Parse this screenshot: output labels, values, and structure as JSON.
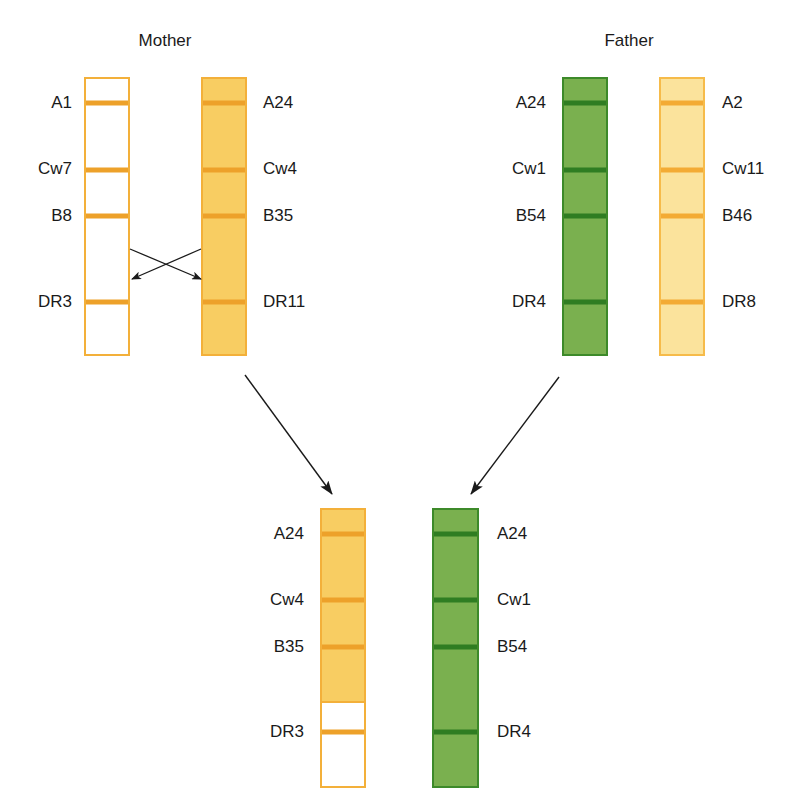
{
  "colors": {
    "orange_border": "#f3b03a",
    "orange_band": "#eda12a",
    "orange_fill": "#f8cd62",
    "light_fill": "#fbe39c",
    "light_border": "#f6bb4a",
    "green_fill": "#7ab04f",
    "green_border": "#3d8a2a",
    "green_band": "#2f7d22",
    "white_fill": "#ffffff",
    "arrow": "#1a1a1a"
  },
  "mother": {
    "title": "Mother",
    "chromosomes": [
      {
        "id": "mother-1",
        "alleles": [
          "A1",
          "Cw7",
          "B8",
          "DR3"
        ],
        "style": "white-orange"
      },
      {
        "id": "mother-2",
        "alleles": [
          "A24",
          "Cw4",
          "B35",
          "DR11"
        ],
        "style": "orange"
      }
    ]
  },
  "father": {
    "title": "Father",
    "chromosomes": [
      {
        "id": "father-1",
        "alleles": [
          "A24",
          "Cw1",
          "B54",
          "DR4"
        ],
        "style": "green"
      },
      {
        "id": "father-2",
        "alleles": [
          "A2",
          "Cw11",
          "B46",
          "DR8"
        ],
        "style": "light-orange"
      }
    ]
  },
  "child": {
    "chromosomes": [
      {
        "id": "child-maternal",
        "alleles": [
          "A24",
          "Cw4",
          "B35",
          "DR3"
        ],
        "style": "orange-recombinant"
      },
      {
        "id": "child-paternal",
        "alleles": [
          "A24",
          "Cw1",
          "B54",
          "DR4"
        ],
        "style": "green"
      }
    ]
  },
  "labels": {
    "m1": [
      "A1",
      "Cw7",
      "B8",
      "DR3"
    ],
    "m2": [
      "A24",
      "Cw4",
      "B35",
      "DR11"
    ],
    "f1": [
      "A24",
      "Cw1",
      "B54",
      "DR4"
    ],
    "f2": [
      "A2",
      "Cw11",
      "B46",
      "DR8"
    ],
    "c1": [
      "A24",
      "Cw4",
      "B35",
      "DR3"
    ],
    "c2": [
      "A24",
      "Cw1",
      "B54",
      "DR4"
    ]
  },
  "annotations": {
    "crossover": "Recombination between B and DR loci on maternal chromosomes",
    "inheritance_arrows": [
      "mother-2 to child-maternal",
      "father-1 to child-paternal"
    ]
  }
}
